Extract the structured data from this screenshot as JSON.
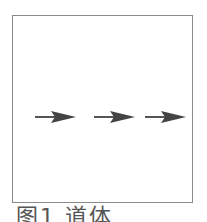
{
  "figure": {
    "caption": "图1  道体",
    "arrows": [
      {
        "name": "arrow-1",
        "direction": "right"
      },
      {
        "name": "arrow-2",
        "direction": "right"
      },
      {
        "name": "arrow-3",
        "direction": "right"
      }
    ],
    "colors": {
      "border": "#8a8a8a",
      "arrow": "#444444",
      "caption": "#555555"
    }
  }
}
